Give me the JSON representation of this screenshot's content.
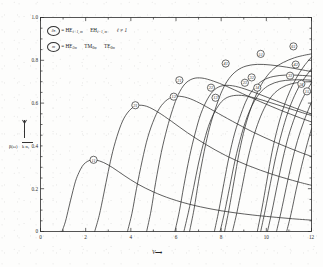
{
  "figure": {
    "kind": "modal-dispersion-curves",
    "background": "#fdfdfc",
    "ink": "#2b2b2b"
  },
  "axes": {
    "x": {
      "label": "V",
      "arrow": "⟶",
      "ticks": [
        "0",
        "2",
        "4",
        "6",
        "8",
        "10",
        "12"
      ],
      "tick_values": [
        0,
        2,
        4,
        6,
        8,
        10,
        12
      ],
      "minor_step": 1,
      "range": [
        0,
        12
      ]
    },
    "y": {
      "ticks": [
        "0.2",
        "0.4",
        "0.6",
        "0.8",
        "1.0"
      ],
      "tick_values": [
        0.2,
        0.4,
        0.6,
        0.8,
        1.0
      ],
      "minor_step": 0.05,
      "range": [
        0,
        1.0
      ],
      "label_numerator": "β(ω)",
      "label_denominator": "k n₁",
      "label_arrow": "↑"
    }
  },
  "legend": {
    "entries": [
      {
        "marker": "ℓn",
        "equals": "=",
        "terms": [
          "HE",
          "EH"
        ],
        "sub1": "ℓ+1, m",
        "sub2": "ℓ−1, m",
        "condition": "ℓ ≠ 1"
      },
      {
        "marker": "m",
        "equals": "=",
        "terms": [
          "HE",
          "TM",
          "TE"
        ],
        "sub1": "2m",
        "sub2": "0m",
        "sub3": "0m"
      }
    ]
  },
  "chart_data": {
    "type": "line",
    "title": "",
    "xlabel": "V",
    "ylabel": "β(ω)/k n₁",
    "xlim": [
      0,
      12
    ],
    "ylim": [
      0,
      1.0
    ],
    "grid": false,
    "legend_position": "top-left",
    "note": "Normalized propagation constant versus normalized frequency for guided modes of an optical fiber; each curve rises to a peak then decays, and is tagged with a circled mode index.",
    "series": [
      {
        "name": "11",
        "label": "11",
        "label_point": [
          2.35,
          0.335
        ],
        "points": [
          [
            0.95,
            0.0
          ],
          [
            1.1,
            0.045
          ],
          [
            1.25,
            0.11
          ],
          [
            1.4,
            0.175
          ],
          [
            1.55,
            0.235
          ],
          [
            1.7,
            0.275
          ],
          [
            1.85,
            0.305
          ],
          [
            2.0,
            0.322
          ],
          [
            2.2,
            0.333
          ],
          [
            2.45,
            0.334
          ],
          [
            2.8,
            0.322
          ],
          [
            3.2,
            0.298
          ],
          [
            3.7,
            0.262
          ],
          [
            4.3,
            0.222
          ],
          [
            5.0,
            0.185
          ],
          [
            5.8,
            0.152
          ],
          [
            6.8,
            0.122
          ],
          [
            8.0,
            0.097
          ],
          [
            9.4,
            0.077
          ],
          [
            11.0,
            0.061
          ],
          [
            12.0,
            0.053
          ]
        ]
      },
      {
        "name": "21",
        "label": "21",
        "label_point": [
          4.2,
          0.59
        ],
        "points": [
          [
            2.4,
            0.0
          ],
          [
            2.6,
            0.075
          ],
          [
            2.8,
            0.175
          ],
          [
            3.0,
            0.28
          ],
          [
            3.2,
            0.375
          ],
          [
            3.45,
            0.465
          ],
          [
            3.7,
            0.53
          ],
          [
            4.0,
            0.572
          ],
          [
            4.3,
            0.589
          ],
          [
            4.7,
            0.585
          ],
          [
            5.2,
            0.558
          ],
          [
            5.8,
            0.515
          ],
          [
            6.5,
            0.462
          ],
          [
            7.3,
            0.408
          ],
          [
            8.2,
            0.355
          ],
          [
            9.2,
            0.308
          ],
          [
            10.3,
            0.266
          ],
          [
            11.4,
            0.232
          ],
          [
            12.0,
            0.216
          ]
        ]
      },
      {
        "name": "12",
        "label": "12",
        "label_point": [
          5.9,
          0.63
        ],
        "points": [
          [
            3.85,
            0.0
          ],
          [
            4.05,
            0.085
          ],
          [
            4.25,
            0.2
          ],
          [
            4.5,
            0.33
          ],
          [
            4.75,
            0.44
          ],
          [
            5.05,
            0.53
          ],
          [
            5.35,
            0.588
          ],
          [
            5.7,
            0.622
          ],
          [
            6.05,
            0.632
          ],
          [
            6.5,
            0.625
          ],
          [
            7.05,
            0.6
          ],
          [
            7.7,
            0.562
          ],
          [
            8.5,
            0.515
          ],
          [
            9.4,
            0.465
          ],
          [
            10.4,
            0.417
          ],
          [
            11.4,
            0.374
          ],
          [
            12.0,
            0.351
          ]
        ]
      },
      {
        "name": "31",
        "label": "31",
        "label_point": [
          6.15,
          0.707
        ],
        "points": [
          [
            4.7,
            0.0
          ],
          [
            4.9,
            0.1
          ],
          [
            5.1,
            0.23
          ],
          [
            5.35,
            0.37
          ],
          [
            5.6,
            0.48
          ],
          [
            5.85,
            0.57
          ],
          [
            6.1,
            0.64
          ],
          [
            6.4,
            0.69
          ],
          [
            6.75,
            0.714
          ],
          [
            7.15,
            0.717
          ],
          [
            7.65,
            0.703
          ],
          [
            8.25,
            0.678
          ],
          [
            8.95,
            0.644
          ],
          [
            9.75,
            0.606
          ],
          [
            10.6,
            0.568
          ],
          [
            11.5,
            0.531
          ],
          [
            12.0,
            0.512
          ]
        ]
      },
      {
        "name": "22",
        "label": "22",
        "label_point": [
          7.55,
          0.672
        ],
        "points": [
          [
            5.95,
            0.0
          ],
          [
            6.15,
            0.095
          ],
          [
            6.35,
            0.215
          ],
          [
            6.6,
            0.35
          ],
          [
            6.85,
            0.46
          ],
          [
            7.1,
            0.55
          ],
          [
            7.4,
            0.62
          ],
          [
            7.7,
            0.662
          ],
          [
            8.05,
            0.681
          ],
          [
            8.5,
            0.681
          ],
          [
            9.05,
            0.666
          ],
          [
            9.7,
            0.641
          ],
          [
            10.45,
            0.61
          ],
          [
            11.25,
            0.578
          ],
          [
            12.0,
            0.549
          ]
        ]
      },
      {
        "name": "13",
        "label": "13",
        "label_point": [
          7.75,
          0.625
        ],
        "points": [
          [
            6.35,
            0.0
          ],
          [
            6.55,
            0.09
          ],
          [
            6.78,
            0.205
          ],
          [
            7.0,
            0.32
          ],
          [
            7.25,
            0.425
          ],
          [
            7.5,
            0.51
          ],
          [
            7.8,
            0.575
          ],
          [
            8.1,
            0.615
          ],
          [
            8.45,
            0.633
          ],
          [
            8.9,
            0.636
          ],
          [
            9.45,
            0.625
          ],
          [
            10.1,
            0.605
          ],
          [
            10.85,
            0.58
          ],
          [
            11.6,
            0.555
          ],
          [
            12.0,
            0.542
          ]
        ]
      },
      {
        "name": "41",
        "label": "41",
        "label_point": [
          8.2,
          0.785
        ],
        "points": [
          [
            6.6,
            0.0
          ],
          [
            6.8,
            0.105
          ],
          [
            7.0,
            0.235
          ],
          [
            7.25,
            0.375
          ],
          [
            7.5,
            0.49
          ],
          [
            7.78,
            0.585
          ],
          [
            8.05,
            0.66
          ],
          [
            8.35,
            0.715
          ],
          [
            8.7,
            0.752
          ],
          [
            9.1,
            0.773
          ],
          [
            9.6,
            0.781
          ],
          [
            10.2,
            0.778
          ],
          [
            10.9,
            0.768
          ],
          [
            11.6,
            0.755
          ],
          [
            12.0,
            0.747
          ]
        ]
      },
      {
        "name": "32",
        "label": "32",
        "label_point": [
          9.35,
          0.72
        ],
        "points": [
          [
            7.7,
            0.0
          ],
          [
            7.9,
            0.1
          ],
          [
            8.12,
            0.225
          ],
          [
            8.35,
            0.35
          ],
          [
            8.6,
            0.46
          ],
          [
            8.88,
            0.55
          ],
          [
            9.15,
            0.62
          ],
          [
            9.48,
            0.672
          ],
          [
            9.85,
            0.706
          ],
          [
            10.3,
            0.724
          ],
          [
            10.85,
            0.731
          ],
          [
            11.45,
            0.73
          ],
          [
            12.0,
            0.726
          ]
        ]
      },
      {
        "name": "51",
        "label": "51",
        "label_point": [
          9.75,
          0.83
        ],
        "points": [
          [
            8.15,
            0.0
          ],
          [
            8.35,
            0.105
          ],
          [
            8.57,
            0.235
          ],
          [
            8.8,
            0.37
          ],
          [
            9.05,
            0.485
          ],
          [
            9.33,
            0.58
          ],
          [
            9.62,
            0.655
          ],
          [
            9.95,
            0.715
          ],
          [
            10.32,
            0.76
          ],
          [
            10.75,
            0.79
          ],
          [
            11.25,
            0.812
          ],
          [
            11.7,
            0.824
          ],
          [
            12.0,
            0.83
          ]
        ]
      },
      {
        "name": "23",
        "label": "23",
        "label_point": [
          9.05,
          0.695
        ],
        "points": [
          [
            7.95,
            0.0
          ],
          [
            8.15,
            0.09
          ],
          [
            8.38,
            0.21
          ],
          [
            8.62,
            0.335
          ],
          [
            8.88,
            0.445
          ],
          [
            9.15,
            0.535
          ],
          [
            9.45,
            0.605
          ],
          [
            9.78,
            0.655
          ],
          [
            10.15,
            0.685
          ],
          [
            10.6,
            0.702
          ],
          [
            11.1,
            0.708
          ],
          [
            11.6,
            0.709
          ],
          [
            12.0,
            0.707
          ]
        ]
      },
      {
        "name": "14",
        "label": "14",
        "label_point": [
          9.6,
          0.672
        ],
        "points": [
          [
            8.5,
            0.0
          ],
          [
            8.7,
            0.09
          ],
          [
            8.92,
            0.205
          ],
          [
            9.15,
            0.325
          ],
          [
            9.4,
            0.43
          ],
          [
            9.68,
            0.52
          ],
          [
            9.98,
            0.59
          ],
          [
            10.3,
            0.64
          ],
          [
            10.68,
            0.672
          ],
          [
            11.1,
            0.69
          ],
          [
            11.55,
            0.698
          ],
          [
            12.0,
            0.7
          ]
        ]
      },
      {
        "name": "61",
        "label": "61",
        "label_point": [
          11.2,
          0.865
        ],
        "points": [
          [
            9.6,
            0.0
          ],
          [
            9.8,
            0.105
          ],
          [
            10.02,
            0.235
          ],
          [
            10.25,
            0.37
          ],
          [
            10.5,
            0.485
          ],
          [
            10.78,
            0.585
          ],
          [
            11.08,
            0.665
          ],
          [
            11.4,
            0.73
          ],
          [
            11.72,
            0.78
          ],
          [
            12.0,
            0.815
          ]
        ]
      },
      {
        "name": "42",
        "label": "42",
        "label_point": [
          11.3,
          0.78
        ],
        "points": [
          [
            9.75,
            0.0
          ],
          [
            9.95,
            0.1
          ],
          [
            10.18,
            0.225
          ],
          [
            10.42,
            0.35
          ],
          [
            10.68,
            0.46
          ],
          [
            10.95,
            0.555
          ],
          [
            11.25,
            0.635
          ],
          [
            11.58,
            0.7
          ],
          [
            12.0,
            0.76
          ]
        ]
      },
      {
        "name": "33",
        "label": "33",
        "label_point": [
          11.05,
          0.728
        ],
        "points": [
          [
            10.05,
            0.0
          ],
          [
            10.25,
            0.095
          ],
          [
            10.48,
            0.215
          ],
          [
            10.72,
            0.335
          ],
          [
            10.98,
            0.445
          ],
          [
            11.28,
            0.54
          ],
          [
            11.6,
            0.62
          ],
          [
            12.0,
            0.695
          ]
        ]
      },
      {
        "name": "24",
        "label": "24",
        "label_point": [
          11.55,
          0.69
        ],
        "points": [
          [
            10.45,
            0.0
          ],
          [
            10.65,
            0.09
          ],
          [
            10.88,
            0.205
          ],
          [
            11.12,
            0.32
          ],
          [
            11.38,
            0.425
          ],
          [
            11.68,
            0.52
          ],
          [
            12.0,
            0.605
          ]
        ]
      },
      {
        "name": "15",
        "label": "15",
        "label_point": [
          11.8,
          0.655
        ],
        "points": [
          [
            10.9,
            0.0
          ],
          [
            11.1,
            0.085
          ],
          [
            11.32,
            0.195
          ],
          [
            11.56,
            0.305
          ],
          [
            11.8,
            0.405
          ],
          [
            12.0,
            0.48
          ]
        ]
      }
    ]
  }
}
